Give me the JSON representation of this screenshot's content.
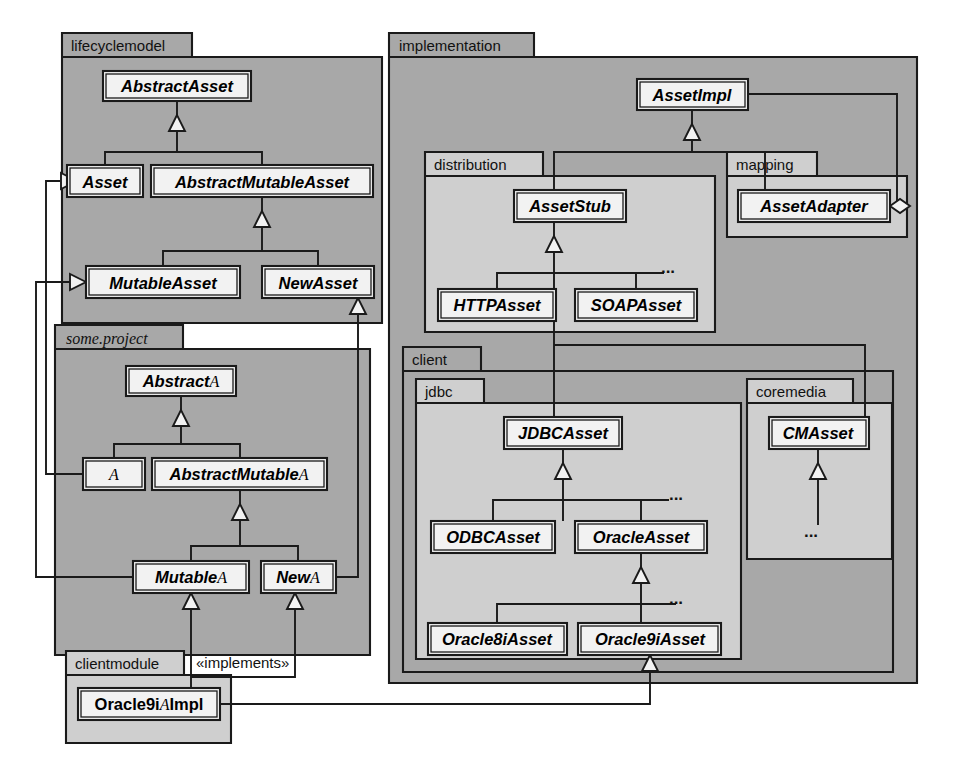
{
  "diagram": {
    "colors": {
      "page_background": "#ffffff",
      "outer_package_fill": "#a8a8a8",
      "inner_package_fill": "#cfcfcf",
      "class_fill": "#f2f2f2",
      "line": "#1a1a1a",
      "text": "#000000"
    }
  },
  "packages": [
    {
      "id": "lifecyclemodel",
      "label": "lifecyclemodel",
      "style": "outer",
      "label_style": "sans",
      "x": 62,
      "y": 33,
      "w": 320,
      "h": 290,
      "tab_w": 130,
      "tab_h": 24
    },
    {
      "id": "someproject",
      "label": "some.project",
      "style": "outer",
      "label_style": "serif-italic",
      "x": 55,
      "y": 325,
      "w": 315,
      "h": 330,
      "tab_w": 128,
      "tab_h": 24
    },
    {
      "id": "clientmodule",
      "label": "clientmodule",
      "style": "inner",
      "label_style": "sans",
      "x": 66,
      "y": 651,
      "w": 165,
      "h": 92,
      "tab_w": 118,
      "tab_h": 24
    },
    {
      "id": "implementation",
      "label": "implementation",
      "style": "outer",
      "label_style": "sans",
      "x": 389,
      "y": 33,
      "w": 528,
      "h": 650,
      "tab_w": 145,
      "tab_h": 24
    },
    {
      "id": "distribution",
      "label": "distribution",
      "style": "inner",
      "label_style": "sans",
      "x": 425,
      "y": 152,
      "w": 290,
      "h": 180,
      "tab_w": 118,
      "tab_h": 24
    },
    {
      "id": "mapping",
      "label": "mapping",
      "style": "inner",
      "label_style": "sans",
      "x": 727,
      "y": 152,
      "w": 180,
      "h": 85,
      "tab_w": 90,
      "tab_h": 24
    },
    {
      "id": "client",
      "label": "client",
      "style": "outer",
      "label_style": "sans",
      "x": 403,
      "y": 347,
      "w": 490,
      "h": 325,
      "tab_w": 78,
      "tab_h": 24
    },
    {
      "id": "jdbc",
      "label": "jdbc",
      "style": "inner",
      "label_style": "sans",
      "x": 416,
      "y": 379,
      "w": 325,
      "h": 280,
      "tab_w": 68,
      "tab_h": 24
    },
    {
      "id": "coremedia",
      "label": "coremedia",
      "style": "inner",
      "label_style": "sans",
      "x": 747,
      "y": 379,
      "w": 145,
      "h": 180,
      "tab_w": 106,
      "tab_h": 24
    }
  ],
  "classes": [
    {
      "id": "AbstractAsset",
      "label": "AbstractAsset",
      "suffix": "",
      "style": "italic",
      "x": 103,
      "y": 71,
      "w": 148,
      "h": 30
    },
    {
      "id": "Asset",
      "label": "Asset",
      "suffix": "",
      "style": "italic",
      "x": 67,
      "y": 165,
      "w": 76,
      "h": 32
    },
    {
      "id": "AbstractMutableAsset",
      "label": "AbstractMutableAsset",
      "suffix": "",
      "style": "italic",
      "x": 151,
      "y": 165,
      "w": 222,
      "h": 32
    },
    {
      "id": "MutableAsset",
      "label": "MutableAsset",
      "suffix": "",
      "style": "italic",
      "x": 86,
      "y": 266,
      "w": 154,
      "h": 32
    },
    {
      "id": "NewAsset",
      "label": "NewAsset",
      "suffix": "",
      "style": "italic",
      "x": 262,
      "y": 266,
      "w": 112,
      "h": 32
    },
    {
      "id": "AbstractA",
      "label": "Abstract",
      "suffix": "A",
      "style": "italic",
      "x": 126,
      "y": 366,
      "w": 110,
      "h": 30
    },
    {
      "id": "A",
      "label": "",
      "suffix": "A",
      "style": "italic",
      "x": 83,
      "y": 458,
      "w": 62,
      "h": 32
    },
    {
      "id": "AbstractMutableA",
      "label": "AbstractMutable",
      "suffix": "A",
      "style": "italic",
      "x": 152,
      "y": 458,
      "w": 175,
      "h": 32
    },
    {
      "id": "MutableA",
      "label": "Mutable",
      "suffix": "A",
      "style": "italic",
      "x": 133,
      "y": 561,
      "w": 116,
      "h": 32
    },
    {
      "id": "NewA",
      "label": "New",
      "suffix": "A",
      "style": "italic",
      "x": 261,
      "y": 561,
      "w": 75,
      "h": 32
    },
    {
      "id": "Oracle9iAImpl",
      "label": "Oracle9i",
      "suffix": "A",
      "suffix2": "Impl",
      "style": "bold",
      "x": 78,
      "y": 688,
      "w": 142,
      "h": 32
    },
    {
      "id": "AssetImpl",
      "label": "AssetImpl",
      "suffix": "",
      "style": "italic",
      "x": 637,
      "y": 79,
      "w": 111,
      "h": 31
    },
    {
      "id": "AssetStub",
      "label": "AssetStub",
      "suffix": "",
      "style": "italic",
      "x": 514,
      "y": 190,
      "w": 112,
      "h": 32
    },
    {
      "id": "HTTPAsset",
      "label": "HTTPAsset",
      "suffix": "",
      "style": "italic",
      "x": 438,
      "y": 289,
      "w": 118,
      "h": 32
    },
    {
      "id": "SOAPAsset",
      "label": "SOAPAsset",
      "suffix": "",
      "style": "italic",
      "x": 575,
      "y": 289,
      "w": 122,
      "h": 32
    },
    {
      "id": "AssetAdapter",
      "label": "AssetAdapter",
      "suffix": "",
      "style": "italic",
      "x": 738,
      "y": 190,
      "w": 152,
      "h": 32
    },
    {
      "id": "JDBCAsset",
      "label": "JDBCAsset",
      "suffix": "",
      "style": "italic",
      "x": 504,
      "y": 417,
      "w": 118,
      "h": 32
    },
    {
      "id": "ODBCAsset",
      "label": "ODBCAsset",
      "suffix": "",
      "style": "italic",
      "x": 431,
      "y": 521,
      "w": 124,
      "h": 32
    },
    {
      "id": "OracleAsset",
      "label": "OracleAsset",
      "suffix": "",
      "style": "italic",
      "x": 575,
      "y": 521,
      "w": 132,
      "h": 32
    },
    {
      "id": "Oracle8iAsset",
      "label": "Oracle8iAsset",
      "suffix": "",
      "style": "italic",
      "x": 428,
      "y": 623,
      "w": 139,
      "h": 32
    },
    {
      "id": "Oracle9iAsset",
      "label": "Oracle9iAsset",
      "suffix": "",
      "style": "italic",
      "x": 578,
      "y": 623,
      "w": 143,
      "h": 32
    },
    {
      "id": "CMAsset",
      "label": "CMAsset",
      "suffix": "",
      "style": "italic",
      "x": 769,
      "y": 417,
      "w": 100,
      "h": 32
    }
  ],
  "annotations": [
    {
      "id": "implements-stereotype",
      "text": "«implements»",
      "x": 196,
      "y": 668
    },
    {
      "id": "ellipsis-distribution",
      "text": "...",
      "x": 668,
      "y": 273
    },
    {
      "id": "ellipsis-jdbc-1",
      "text": "...",
      "x": 676,
      "y": 500
    },
    {
      "id": "ellipsis-jdbc-2",
      "text": "...",
      "x": 676,
      "y": 604
    },
    {
      "id": "ellipsis-coremedia",
      "text": "...",
      "x": 811,
      "y": 537
    }
  ],
  "relationships": [
    {
      "id": "AbstractAsset-Asset",
      "type": "generalization",
      "from": "Asset",
      "to": "AbstractAsset"
    },
    {
      "id": "AbstractAsset-AbstractMutable",
      "type": "generalization",
      "from": "AbstractMutableAsset",
      "to": "AbstractAsset"
    },
    {
      "id": "AbstractMutableAsset-MutableAsset",
      "type": "generalization",
      "from": "MutableAsset",
      "to": "AbstractMutableAsset"
    },
    {
      "id": "AbstractMutableAsset-NewAsset",
      "type": "generalization",
      "from": "NewAsset",
      "to": "AbstractMutableAsset"
    },
    {
      "id": "Asset-A",
      "type": "generalization",
      "from": "A",
      "to": "Asset"
    },
    {
      "id": "MutableAsset-MutableA",
      "type": "generalization",
      "from": "MutableA",
      "to": "MutableAsset"
    },
    {
      "id": "NewAsset-NewA",
      "type": "generalization",
      "from": "NewA",
      "to": "NewAsset"
    },
    {
      "id": "AbstractA-A",
      "type": "generalization",
      "from": "A",
      "to": "AbstractA"
    },
    {
      "id": "AbstractA-AbstractMutableA",
      "type": "generalization",
      "from": "AbstractMutableA",
      "to": "AbstractA"
    },
    {
      "id": "AbstractMutableA-MutableA",
      "type": "generalization",
      "from": "MutableA",
      "to": "AbstractMutableA"
    },
    {
      "id": "AbstractMutableA-NewA",
      "type": "generalization",
      "from": "NewA",
      "to": "AbstractMutableA"
    },
    {
      "id": "MutableA-Oracle9iAImpl",
      "type": "realization",
      "from": "Oracle9iAImpl",
      "to": "MutableA"
    },
    {
      "id": "NewA-Oracle9iAImpl",
      "type": "realization",
      "from": "Oracle9iAImpl",
      "to": "NewA"
    },
    {
      "id": "Oracle9iAsset-Oracle9iAImpl",
      "type": "generalization",
      "from": "Oracle9iAImpl",
      "to": "Oracle9iAsset"
    },
    {
      "id": "AssetImpl-AssetStub",
      "type": "generalization",
      "from": "AssetStub",
      "to": "AssetImpl"
    },
    {
      "id": "AssetImpl-AssetAdapter",
      "type": "generalization",
      "from": "AssetAdapter",
      "to": "AssetImpl"
    },
    {
      "id": "AssetAdapter-AssetImpl-agg",
      "type": "aggregation",
      "from": "AssetAdapter",
      "to": "AssetImpl"
    },
    {
      "id": "AssetStub-HTTPAsset",
      "type": "generalization",
      "from": "HTTPAsset",
      "to": "AssetStub"
    },
    {
      "id": "AssetStub-SOAPAsset",
      "type": "generalization",
      "from": "SOAPAsset",
      "to": "AssetStub"
    },
    {
      "id": "AssetStub-JDBCAsset",
      "type": "generalization",
      "from": "JDBCAsset",
      "to": "AssetStub"
    },
    {
      "id": "AssetStub-CMAsset",
      "type": "generalization",
      "from": "CMAsset",
      "to": "AssetStub"
    },
    {
      "id": "JDBCAsset-ODBCAsset",
      "type": "generalization",
      "from": "ODBCAsset",
      "to": "JDBCAsset"
    },
    {
      "id": "JDBCAsset-OracleAsset",
      "type": "generalization",
      "from": "OracleAsset",
      "to": "JDBCAsset"
    },
    {
      "id": "OracleAsset-Oracle8iAsset",
      "type": "generalization",
      "from": "Oracle8iAsset",
      "to": "OracleAsset"
    },
    {
      "id": "OracleAsset-Oracle9iAsset",
      "type": "generalization",
      "from": "Oracle9iAsset",
      "to": "OracleAsset"
    }
  ]
}
